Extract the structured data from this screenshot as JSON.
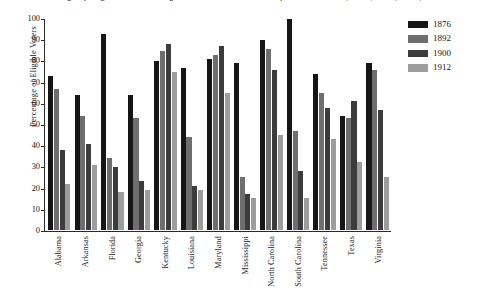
{
  "chart_data": {
    "type": "bar",
    "title": "Percentage of Eligible Voters Voting in Presidential Elections of Southern States, 1876, 1892, 1900, 1912",
    "xlabel": "",
    "ylabel": "Percentage of Eligible Voters",
    "ylim": [
      0,
      100
    ],
    "yticks": [
      0,
      10,
      20,
      30,
      40,
      50,
      60,
      70,
      80,
      90,
      100
    ],
    "grid": false,
    "legend_position": "right",
    "categories": [
      "Alabama",
      "Arkansas",
      "Florida",
      "Georgia",
      "Kentucky",
      "Louisiana",
      "Maryland",
      "Mississippi",
      "North Carolina",
      "South Carolina",
      "Tennessee",
      "Texas",
      "Virginia"
    ],
    "series": [
      {
        "name": "1876",
        "color": "#161616",
        "values": [
          73,
          64,
          93,
          64,
          80,
          77,
          81,
          79,
          90,
          100,
          74,
          54,
          79
        ]
      },
      {
        "name": "1892",
        "color": "#6e6e6e",
        "values": [
          67,
          54,
          34,
          53,
          85,
          44,
          83,
          25,
          86,
          47,
          65,
          53,
          76
        ]
      },
      {
        "name": "1900",
        "color": "#3c3c3c",
        "values": [
          38,
          41,
          30,
          23,
          88,
          21,
          87,
          17,
          76,
          28,
          58,
          61,
          57
        ]
      },
      {
        "name": "1912",
        "color": "#9d9d9d",
        "values": [
          22,
          31,
          18,
          19,
          75,
          19,
          65,
          15,
          45,
          15,
          43,
          32,
          25
        ]
      }
    ]
  },
  "legend": {
    "items": [
      {
        "label": "1876",
        "color": "#161616"
      },
      {
        "label": "1892",
        "color": "#6e6e6e"
      },
      {
        "label": "1900",
        "color": "#3c3c3c"
      },
      {
        "label": "1912",
        "color": "#9d9d9d"
      }
    ]
  }
}
